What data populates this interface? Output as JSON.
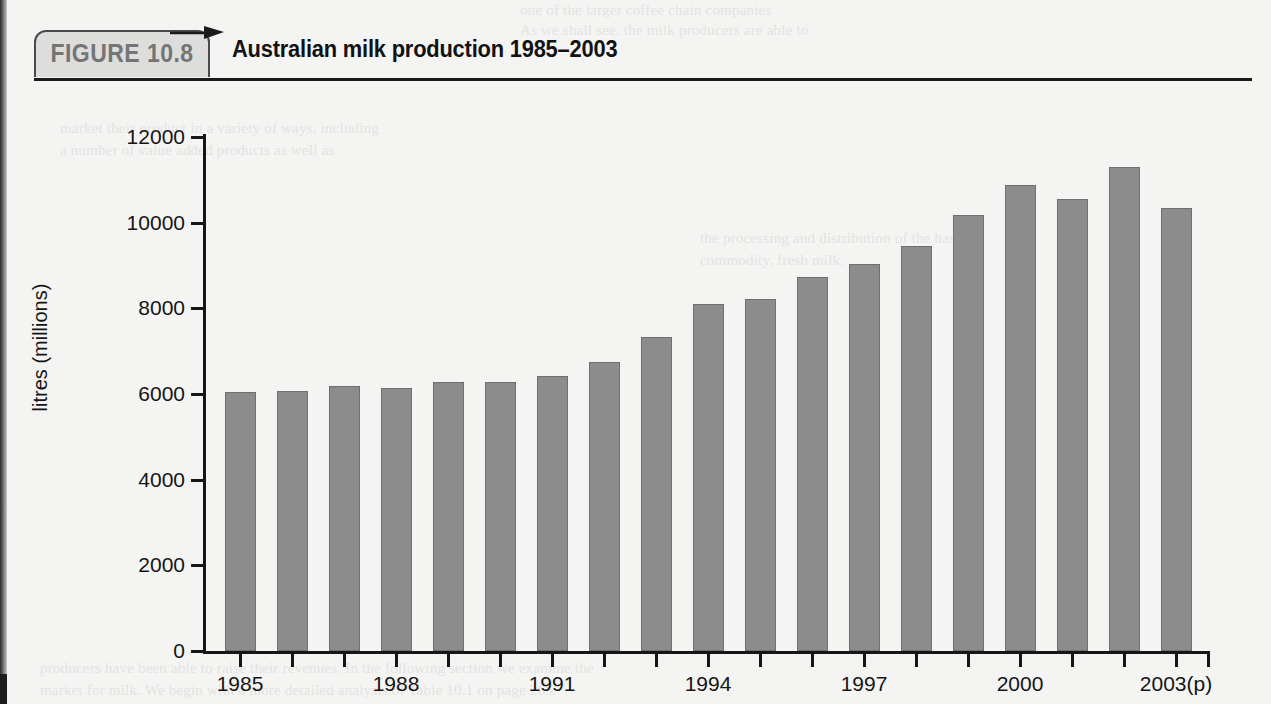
{
  "figure": {
    "tag": "FIGURE 10.8",
    "title": "Australian milk production 1985–2003"
  },
  "chart_data": {
    "type": "bar",
    "title": "Australian milk production 1985–2003",
    "xlabel": "",
    "ylabel": "litres (millions)",
    "ylim": [
      0,
      12000
    ],
    "ytick_labels": [
      "12000",
      "10000",
      "8000",
      "6000",
      "4000",
      "2000",
      "0"
    ],
    "ytick_values": [
      12000,
      10000,
      8000,
      6000,
      4000,
      2000,
      0
    ],
    "grid": false,
    "legend": null,
    "bar_color": "#8c8c8c",
    "categories": [
      "1985",
      "1986",
      "1987",
      "1988",
      "1989",
      "1990",
      "1991",
      "1992",
      "1993",
      "1994",
      "1995",
      "1996",
      "1997",
      "1998",
      "1999",
      "2000",
      "2001",
      "2002",
      "2003(p)"
    ],
    "xtick_labels_shown": [
      "1985",
      "1988",
      "1991",
      "1994",
      "1997",
      "2000",
      "2003(p)"
    ],
    "values": [
      6050,
      6060,
      6190,
      6150,
      6290,
      6270,
      6420,
      6740,
      7330,
      8100,
      8210,
      8720,
      9040,
      9450,
      10180,
      10870,
      10560,
      11300,
      10350
    ]
  },
  "ghost_text": {
    "top1": "one of the larger coffee chain companies",
    "top2": "As we shall see, the milk producers are able to",
    "left1": "market their product in a variety of ways, including",
    "left2": "a number of value added products as well as",
    "right1": "the processing and distribution of the basic",
    "right2": "commodity, fresh milk.",
    "bottom1": "producers have been able to raise their revenues. In the following section we examine the",
    "bottom2": "market for milk. We begin with a more detailed analysis of Table 10.1 on page 265."
  }
}
